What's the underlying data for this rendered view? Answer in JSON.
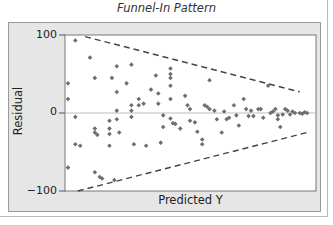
{
  "title": "Funnel-In Pattern",
  "chart_data": {
    "type": "scatter",
    "title": "Funnel-In Pattern",
    "xlabel": "Predicted Y",
    "ylabel": "Residual",
    "yticks": [
      "100",
      "0",
      "−100"
    ],
    "ylim": [
      -100,
      100
    ],
    "xlim": [
      0,
      100
    ],
    "grid": false,
    "zero_line": true,
    "reference_lines": [
      {
        "name": "upper-funnel-bound",
        "style": "dashed",
        "from": [
          7,
          98
        ],
        "to": [
          95,
          27
        ]
      },
      {
        "name": "lower-funnel-bound",
        "style": "dashed",
        "from": [
          4,
          -100
        ],
        "to": [
          98,
          -25
        ]
      }
    ],
    "points": [
      [
        0,
        38
      ],
      [
        0,
        18
      ],
      [
        0,
        -70
      ],
      [
        3,
        93
      ],
      [
        3,
        -5
      ],
      [
        3,
        -40
      ],
      [
        5,
        -42
      ],
      [
        9,
        71
      ],
      [
        11,
        45
      ],
      [
        11,
        -20
      ],
      [
        11,
        -25
      ],
      [
        12,
        -28
      ],
      [
        11,
        -76
      ],
      [
        13,
        -82
      ],
      [
        14,
        -84
      ],
      [
        18,
        45
      ],
      [
        17,
        -10
      ],
      [
        17,
        -20
      ],
      [
        17,
        -27
      ],
      [
        17,
        -42
      ],
      [
        19,
        -86
      ],
      [
        20,
        60
      ],
      [
        20,
        27
      ],
      [
        20,
        3
      ],
      [
        20,
        -8
      ],
      [
        21,
        -25
      ],
      [
        24,
        38
      ],
      [
        26,
        62
      ],
      [
        26,
        10
      ],
      [
        26,
        3
      ],
      [
        26,
        -5
      ],
      [
        27,
        -40
      ],
      [
        29,
        10
      ],
      [
        29,
        18
      ],
      [
        31,
        12
      ],
      [
        32,
        -42
      ],
      [
        34,
        30
      ],
      [
        36,
        48
      ],
      [
        37,
        25
      ],
      [
        37,
        12
      ],
      [
        38,
        -38
      ],
      [
        39,
        -3
      ],
      [
        39,
        -18
      ],
      [
        42,
        45
      ],
      [
        42,
        57
      ],
      [
        42,
        50
      ],
      [
        42,
        35
      ],
      [
        42,
        18
      ],
      [
        42,
        -7
      ],
      [
        43,
        -13
      ],
      [
        44,
        -14
      ],
      [
        46,
        -20
      ],
      [
        48,
        22
      ],
      [
        49,
        10
      ],
      [
        50,
        -10
      ],
      [
        50,
        5
      ],
      [
        52,
        -12
      ],
      [
        53,
        -24
      ],
      [
        55,
        -34
      ],
      [
        55,
        -40
      ],
      [
        56,
        10
      ],
      [
        57,
        8
      ],
      [
        58,
        42
      ],
      [
        58,
        5
      ],
      [
        60,
        3
      ],
      [
        61,
        -8
      ],
      [
        63,
        -25
      ],
      [
        64,
        2
      ],
      [
        65,
        -8
      ],
      [
        66,
        -6
      ],
      [
        68,
        10
      ],
      [
        69,
        -3
      ],
      [
        70,
        -16
      ],
      [
        72,
        18
      ],
      [
        73,
        5
      ],
      [
        74,
        -4
      ],
      [
        75,
        3
      ],
      [
        76,
        -4
      ],
      [
        78,
        5
      ],
      [
        79,
        5
      ],
      [
        80,
        -6
      ],
      [
        82,
        35
      ],
      [
        83,
        0
      ],
      [
        84,
        2
      ],
      [
        85,
        5
      ],
      [
        86,
        -3
      ],
      [
        86,
        -8
      ],
      [
        87,
        -18
      ],
      [
        88,
        -2
      ],
      [
        89,
        5
      ],
      [
        90,
        3
      ],
      [
        91,
        -2
      ],
      [
        92,
        2
      ],
      [
        93,
        0
      ],
      [
        95,
        0
      ],
      [
        96,
        -1
      ],
      [
        97,
        1
      ],
      [
        98,
        0
      ]
    ]
  }
}
